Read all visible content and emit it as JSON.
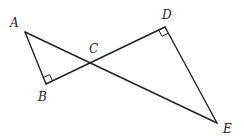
{
  "diagram": {
    "type": "geometry",
    "points": {
      "A": {
        "label": "A",
        "x": 25,
        "y": 32,
        "label_x": 10,
        "label_y": 27
      },
      "B": {
        "label": "B",
        "x": 46,
        "y": 84,
        "label_x": 38,
        "label_y": 101
      },
      "C": {
        "label": "C",
        "x": 93,
        "y": 63,
        "label_x": 89,
        "label_y": 53
      },
      "D": {
        "label": "D",
        "x": 165,
        "y": 27,
        "label_x": 162,
        "label_y": 19
      },
      "E": {
        "label": "E",
        "x": 217,
        "y": 123,
        "label_x": 223,
        "label_y": 133
      }
    },
    "segments": [
      {
        "from": "A",
        "to": "B"
      },
      {
        "from": "B",
        "to": "D"
      },
      {
        "from": "A",
        "to": "E"
      },
      {
        "from": "D",
        "to": "E"
      }
    ],
    "right_angles": [
      "B",
      "D"
    ],
    "colors": {
      "stroke": "#222222",
      "background": "#ffffff"
    }
  }
}
